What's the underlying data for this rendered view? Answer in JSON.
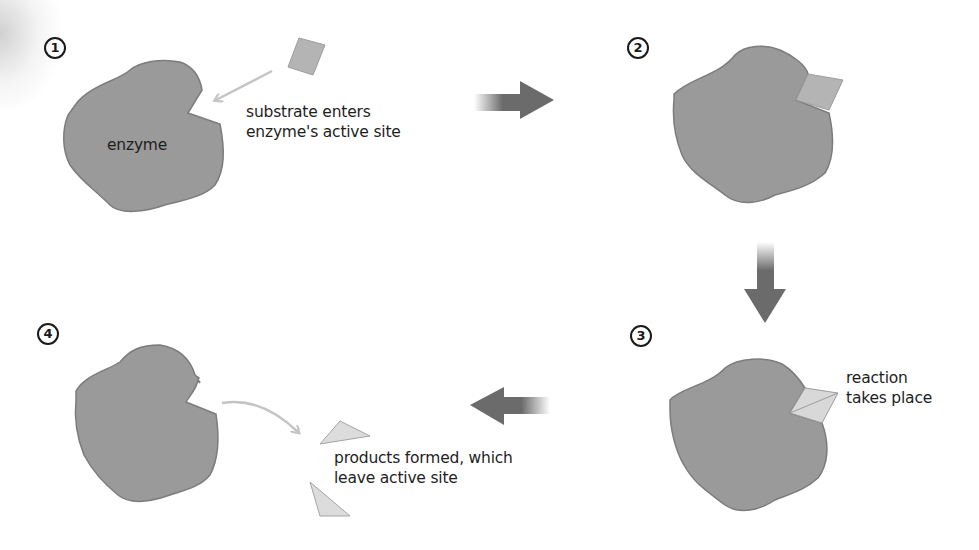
{
  "diagram": {
    "type": "enzyme-substrate reaction process",
    "colors": {
      "enzyme_fill": "#9a9a9a",
      "enzyme_stroke": "#7c7c7c",
      "substrate_fill": "#b4b4b4",
      "product_fill": "#dcdcdc",
      "small_arrow": "#c4c4c4",
      "flow_arrow": "#6b6b6b",
      "text": "#1e1e1e"
    },
    "steps": [
      {
        "number": "1",
        "enzyme_label": "enzyme",
        "caption_line1": "substrate enters",
        "caption_line2": "enzyme's active site"
      },
      {
        "number": "2"
      },
      {
        "number": "3",
        "caption_line1": "reaction",
        "caption_line2": "takes place"
      },
      {
        "number": "4",
        "caption_line1": "products formed, which",
        "caption_line2": "leave active site"
      }
    ],
    "flow_arrows": [
      {
        "from": "1",
        "to": "2",
        "direction": "right"
      },
      {
        "from": "2",
        "to": "3",
        "direction": "down"
      },
      {
        "from": "3",
        "to": "4",
        "direction": "left"
      }
    ]
  }
}
